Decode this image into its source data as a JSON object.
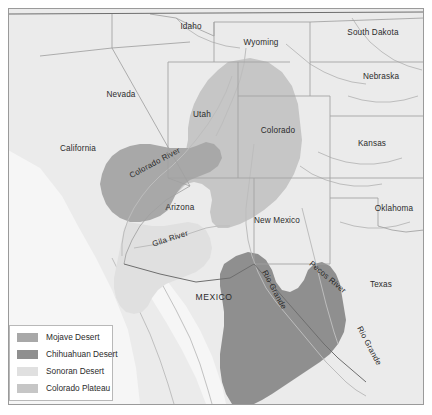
{
  "map": {
    "title": "Southwestern United States Deserts and Colorado Plateau",
    "frame": {
      "border_color": "#9a9a9a",
      "background": "#ffffff"
    },
    "colors": {
      "land": "#ebebeb",
      "land_outside": "#f2f2f2",
      "state_border": "#a0a0a0",
      "country_border": "#6e6e6e",
      "river": "#bdbdbd",
      "mojave": "#a8a8a8",
      "chihuahuan": "#8f8f8f",
      "sonoran": "#e0e0e0",
      "colorado_plateau": "#c6c6c6",
      "label_text": "#2b2b2b"
    },
    "state_labels": [
      {
        "name": "Idaho",
        "x": 191,
        "y": 29
      },
      {
        "name": "Wyoming",
        "x": 261,
        "y": 45
      },
      {
        "name": "South Dakota",
        "x": 373,
        "y": 35
      },
      {
        "name": "Nevada",
        "x": 121,
        "y": 97
      },
      {
        "name": "Utah",
        "x": 202,
        "y": 117
      },
      {
        "name": "Nebraska",
        "x": 381,
        "y": 79
      },
      {
        "name": "Colorado",
        "x": 278,
        "y": 133
      },
      {
        "name": "Kansas",
        "x": 372,
        "y": 146
      },
      {
        "name": "California",
        "x": 78,
        "y": 151
      },
      {
        "name": "Arizona",
        "x": 180,
        "y": 210
      },
      {
        "name": "New Mexico",
        "x": 277,
        "y": 223
      },
      {
        "name": "Oklahoma",
        "x": 394,
        "y": 211
      },
      {
        "name": "Texas",
        "x": 381,
        "y": 287
      }
    ],
    "country_labels": [
      {
        "name": "MEXICO",
        "x": 214,
        "y": 300
      }
    ],
    "river_labels": [
      {
        "name": "Colorado River",
        "x": 156,
        "y": 165,
        "rotation": -28
      },
      {
        "name": "Gila River",
        "x": 171,
        "y": 241,
        "rotation": -18
      },
      {
        "name": "Rio Grande",
        "x": 272,
        "y": 291,
        "rotation": 62
      },
      {
        "name": "Pecos River",
        "x": 326,
        "y": 279,
        "rotation": 40
      },
      {
        "name": "Rio Grande",
        "x": 367,
        "y": 347,
        "rotation": 62
      }
    ]
  },
  "legend": {
    "items": [
      {
        "label": "Mojave Desert",
        "color": "#a8a8a8",
        "swatch_name": "mojave-swatch"
      },
      {
        "label": "Chihuahuan Desert",
        "color": "#8f8f8f",
        "swatch_name": "chihuahuan-swatch"
      },
      {
        "label": "Sonoran Desert",
        "color": "#e0e0e0",
        "swatch_name": "sonoran-swatch"
      },
      {
        "label": "Colorado Plateau",
        "color": "#c6c6c6",
        "swatch_name": "colorado-plateau-swatch"
      }
    ]
  }
}
